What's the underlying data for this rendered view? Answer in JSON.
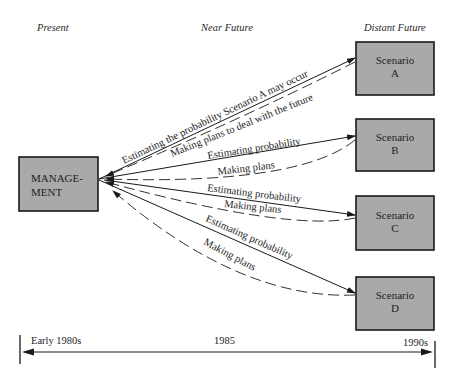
{
  "headers": {
    "present": "Present",
    "near_future": "Near Future",
    "distant_future": "Distant Future"
  },
  "management": {
    "line1": "MANAGE-",
    "line2": "MENT"
  },
  "scenarios": [
    {
      "title": "Scenario",
      "letter": "A"
    },
    {
      "title": "Scenario",
      "letter": "B"
    },
    {
      "title": "Scenario",
      "letter": "C"
    },
    {
      "title": "Scenario",
      "letter": "D"
    }
  ],
  "arrows": {
    "a_estimate": "Estimating the probability Scenario A may occur",
    "a_plans": "Making plans to deal with the future",
    "b_estimate": "Estimating probability",
    "b_plans": "Making plans",
    "c_estimate": "Estimating probability",
    "c_plans": "Making plans",
    "d_estimate": "Estimating probability",
    "d_plans": "Making plans"
  },
  "timeline": {
    "start": "Early 1980s",
    "middle": "1985",
    "end": "1990s"
  },
  "colors": {
    "box_fill": "#a9a9a9",
    "line": "#1a1a1a"
  }
}
